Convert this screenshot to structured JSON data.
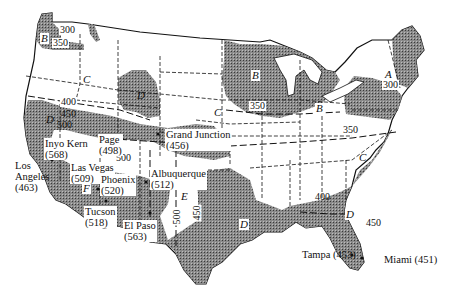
{
  "map": {
    "type": "contour map of the contiguous United States",
    "fill_color_shaded": "#7a7a7a",
    "fill_color_land": "#ffffff",
    "line_color": "#111111"
  },
  "zones": [
    {
      "id": "A",
      "label": "A"
    },
    {
      "id": "B1",
      "label": "B"
    },
    {
      "id": "B2",
      "label": "B"
    },
    {
      "id": "B3",
      "label": "B"
    },
    {
      "id": "C1",
      "label": "C"
    },
    {
      "id": "C2",
      "label": "C"
    },
    {
      "id": "C3",
      "label": "C"
    },
    {
      "id": "D1",
      "label": "D"
    },
    {
      "id": "D2",
      "label": "D"
    },
    {
      "id": "D3",
      "label": "D"
    },
    {
      "id": "E1",
      "label": "E"
    },
    {
      "id": "E2",
      "label": "E"
    },
    {
      "id": "F",
      "label": "F"
    }
  ],
  "contours": [
    {
      "id": "nw300",
      "value": "300"
    },
    {
      "id": "nw350",
      "value": "350"
    },
    {
      "id": "w400",
      "value": "400"
    },
    {
      "id": "w450",
      "value": "450"
    },
    {
      "id": "w500",
      "value": "500"
    },
    {
      "id": "mid500",
      "value": "500"
    },
    {
      "id": "mid400",
      "value": "400"
    },
    {
      "id": "midwest350",
      "value": "350"
    },
    {
      "id": "east350",
      "value": "350"
    },
    {
      "id": "ne300",
      "value": "300"
    },
    {
      "id": "tx500",
      "value": "500"
    },
    {
      "id": "tx450",
      "value": "450"
    },
    {
      "id": "se400",
      "value": "400"
    },
    {
      "id": "se450",
      "value": "450"
    }
  ],
  "cities": [
    {
      "id": "inyo-kern",
      "name": "Inyo Kern",
      "value": "(568)"
    },
    {
      "id": "page",
      "name": "Page",
      "value": "(498)"
    },
    {
      "id": "grand-junction",
      "name": "Grand Junction",
      "value": "(456)"
    },
    {
      "id": "los-angeles",
      "name": "Los Angeles",
      "name_line1": "Los",
      "name_line2": "Angeles",
      "value": "(463)"
    },
    {
      "id": "las-vegas",
      "name": "Las Vegas",
      "value": "(509)"
    },
    {
      "id": "phoenix",
      "name": "Phoenix",
      "value": "(520)"
    },
    {
      "id": "albuquerque",
      "name": "Albuquerque",
      "value": "(512)"
    },
    {
      "id": "tucson",
      "name": "Tucson",
      "value": "(518)"
    },
    {
      "id": "el-paso",
      "name": "El Paso",
      "value": "(563)"
    },
    {
      "id": "tampa",
      "name": "Tampa",
      "label": "Tampa (453)"
    },
    {
      "id": "miami",
      "name": "Miami",
      "label": "Miami (451)"
    }
  ]
}
